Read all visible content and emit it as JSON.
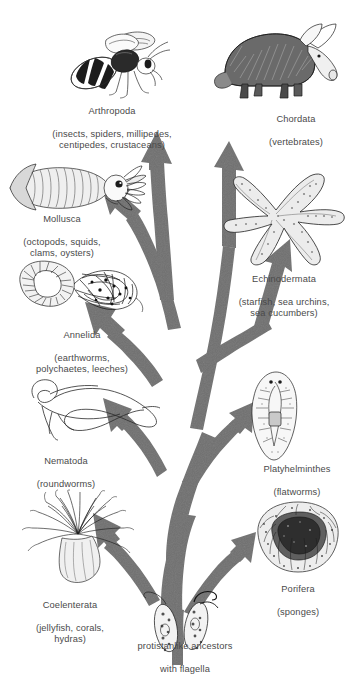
{
  "diagram": {
    "arrow_color": "#707070",
    "background_color": "#ffffff",
    "text_color": "#4a4a4a"
  },
  "root": {
    "name": "protistanlike ancestors",
    "comment": "with flagella"
  },
  "branches": [
    {
      "key": "arthropoda",
      "name": "Arthropoda",
      "comment": "(insects, spiders, millipedes,\ncentipedes, crustaceans)",
      "organism": "honeybee"
    },
    {
      "key": "chordata",
      "name": "Chordata",
      "comment": "(vertebrates)",
      "organism": "aardvark"
    },
    {
      "key": "mollusca",
      "name": "Mollusca",
      "comment": "(octopods, squids,\nclams, oysters)",
      "organism": "squid"
    },
    {
      "key": "echinodermata",
      "name": "Echinodermata",
      "comment": "(starfish, sea urchins,\nsea cucumbers)",
      "organism": "starfish"
    },
    {
      "key": "annelida",
      "name": "Annelida",
      "comment": "(earthworms,\npolychaetes, leeches)",
      "organism": "segmented-worm"
    },
    {
      "key": "nematoda",
      "name": "Nematoda",
      "comment": "(roundworms)",
      "organism": "roundworm"
    },
    {
      "key": "platyhelminthes",
      "name": "Platyhelminthes",
      "comment": "(flatworms)",
      "organism": "flatworm"
    },
    {
      "key": "coelenterata",
      "name": "Coelenterata",
      "comment": "(jellyfish, corals,\nhydras)",
      "organism": "sea-anemone"
    },
    {
      "key": "porifera",
      "name": "Porifera",
      "comment": "(sponges)",
      "organism": "sponge"
    }
  ]
}
